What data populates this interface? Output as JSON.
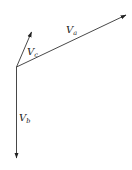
{
  "diagram": {
    "type": "vector-diagram",
    "origin": {
      "x": 16.5,
      "y": 67
    },
    "vectors": [
      {
        "id": "Va",
        "symbol": "V",
        "subscript": "a",
        "tip": {
          "x": 126,
          "y": 15
        },
        "label_pos": {
          "x": 66,
          "y": 33
        }
      },
      {
        "id": "Vc",
        "symbol": "V",
        "subscript": "c",
        "tip": {
          "x": 31.5,
          "y": 32
        },
        "label_pos": {
          "x": 27,
          "y": 55
        }
      },
      {
        "id": "Vb",
        "symbol": "V",
        "subscript": "b",
        "tip": {
          "x": 16.5,
          "y": 158
        },
        "label_pos": {
          "x": 19,
          "y": 121
        }
      }
    ],
    "colors": {
      "line": "#333333",
      "text": "#222222",
      "background": "#ffffff"
    }
  }
}
